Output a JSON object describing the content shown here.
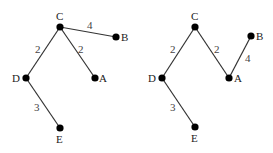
{
  "colors": {
    "edge": "#333333",
    "node": "#000000",
    "text": "#222222"
  },
  "trees": [
    {
      "nodes": [
        {
          "id": "C",
          "x": 60,
          "y": 27,
          "lx": 56,
          "ly": 20
        },
        {
          "id": "B",
          "x": 116,
          "y": 37,
          "lx": 121,
          "ly": 41
        },
        {
          "id": "D",
          "x": 26,
          "y": 78,
          "lx": 12,
          "ly": 82
        },
        {
          "id": "A",
          "x": 95,
          "y": 78,
          "lx": 99,
          "ly": 82
        },
        {
          "id": "E",
          "x": 60,
          "y": 128,
          "lx": 56,
          "ly": 143
        }
      ],
      "edges": [
        {
          "from": "C",
          "to": "B",
          "weight": "4",
          "wx": 87,
          "wy": 29
        },
        {
          "from": "C",
          "to": "D",
          "weight": "2",
          "wx": 35,
          "wy": 53
        },
        {
          "from": "C",
          "to": "A",
          "weight": "2",
          "wx": 78,
          "wy": 53
        },
        {
          "from": "D",
          "to": "E",
          "weight": "3",
          "wx": 34,
          "wy": 111
        }
      ]
    },
    {
      "nodes": [
        {
          "id": "C",
          "x": 195,
          "y": 27,
          "lx": 191,
          "ly": 20
        },
        {
          "id": "B",
          "x": 251,
          "y": 36,
          "lx": 256,
          "ly": 40
        },
        {
          "id": "D",
          "x": 162,
          "y": 78,
          "lx": 148,
          "ly": 82
        },
        {
          "id": "A",
          "x": 229,
          "y": 78,
          "lx": 234,
          "ly": 82
        },
        {
          "id": "E",
          "x": 195,
          "y": 127,
          "lx": 191,
          "ly": 142
        }
      ],
      "edges": [
        {
          "from": "C",
          "to": "D",
          "weight": "2",
          "wx": 170,
          "wy": 53
        },
        {
          "from": "C",
          "to": "A",
          "weight": "2",
          "wx": 214,
          "wy": 53
        },
        {
          "from": "A",
          "to": "B",
          "weight": "4",
          "wx": 245,
          "wy": 62
        },
        {
          "from": "D",
          "to": "E",
          "weight": "3",
          "wx": 170,
          "wy": 111
        }
      ]
    }
  ]
}
